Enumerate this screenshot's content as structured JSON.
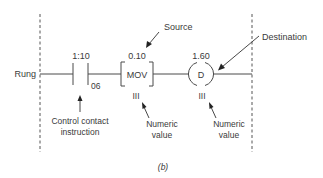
{
  "figure": {
    "caption": "(b)",
    "rung_label": "Rung",
    "contact": {
      "address": "1:10",
      "bit": "06",
      "callout": [
        "Control contact",
        "instruction"
      ]
    },
    "source": {
      "value": "0.10",
      "instruction": "MOV",
      "numeric_marker": "III",
      "label": "Source",
      "callout": [
        "Numeric",
        "value"
      ]
    },
    "destination": {
      "value": "1.60",
      "symbol": "D",
      "numeric_marker": "III",
      "label": "Destination",
      "callout": [
        "Numeric",
        "value"
      ]
    }
  }
}
